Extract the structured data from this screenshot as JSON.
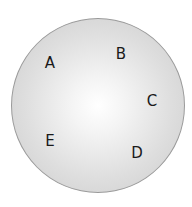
{
  "diagram": {
    "shape": "circle",
    "fill": "radial gradient white center to light gray edge",
    "stroke": "#9a9a9a",
    "labels": [
      {
        "text": "A",
        "x": 50,
        "y": 63
      },
      {
        "text": "B",
        "x": 121,
        "y": 54
      },
      {
        "text": "C",
        "x": 152,
        "y": 101
      },
      {
        "text": "D",
        "x": 137,
        "y": 153
      },
      {
        "text": "E",
        "x": 50,
        "y": 141
      }
    ]
  }
}
